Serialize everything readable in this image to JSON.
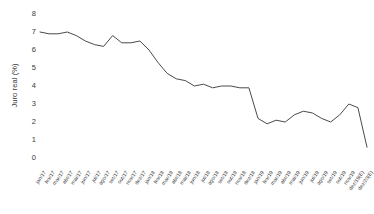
{
  "chart_data": {
    "type": "line",
    "title": "",
    "subtitle": "",
    "xlabel": "",
    "ylabel": "Juro real (%)",
    "ylim": [
      0,
      8
    ],
    "yticks": [
      0,
      1,
      2,
      3,
      4,
      5,
      6,
      7,
      8
    ],
    "ytick_labels": [
      "0",
      "1",
      "2",
      "3",
      "4",
      "5",
      "6",
      "7",
      "8"
    ],
    "grid": false,
    "legend": null,
    "legend_position": "none",
    "line_color": "#4a4a4a",
    "categories": [
      "jan/17",
      "fev/17",
      "mar/17",
      "abr/17",
      "mai/17",
      "jun/17",
      "jul/17",
      "ago/17",
      "set/17",
      "out/17",
      "nov/17",
      "dez/17",
      "jan/18",
      "fev/18",
      "mar/18",
      "abr/18",
      "mai/18",
      "jun/18",
      "jul/18",
      "ago/18",
      "set/18",
      "out/18",
      "nov/18",
      "dez/18",
      "jan/19",
      "fev/19",
      "mar/19",
      "abr/19",
      "mai/19",
      "jun/19",
      "jul/19",
      "ago/19",
      "set/19",
      "out/19",
      "nov/19",
      "dez/19(E)",
      "dez/20(E)"
    ],
    "series": [
      {
        "name": "Juro real",
        "values": [
          7.0,
          6.9,
          6.9,
          7.0,
          6.8,
          6.5,
          6.3,
          6.2,
          6.8,
          6.4,
          6.4,
          6.5,
          6.0,
          5.3,
          4.7,
          4.4,
          4.3,
          4.0,
          4.1,
          3.9,
          4.0,
          4.0,
          3.9,
          3.9,
          2.2,
          1.9,
          2.1,
          2.0,
          2.4,
          2.6,
          2.5,
          2.2,
          2.0,
          2.4,
          3.0,
          2.8,
          0.6
        ]
      }
    ]
  }
}
